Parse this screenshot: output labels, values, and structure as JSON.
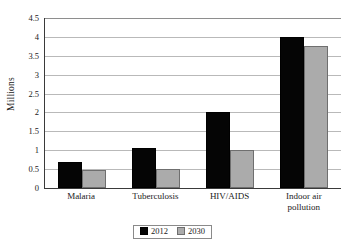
{
  "chart_data": {
    "type": "bar",
    "title": "",
    "subtitle": "",
    "xlabel": "",
    "ylabel": "Millions",
    "ylim": [
      0,
      4.5
    ],
    "ytick_labels": [
      "4.5",
      "4",
      "3.5",
      "3",
      "2.5",
      "2",
      "1.5",
      "1",
      "0.5",
      "0"
    ],
    "ytick_values": [
      4.5,
      4,
      3.5,
      3,
      2.5,
      2,
      1.5,
      1,
      0.5,
      0
    ],
    "grid": true,
    "legend_position": "bottom-center",
    "categories": [
      "Malaria",
      "Tuberculosis",
      "HIV/AIDS",
      "Indoor air pollution"
    ],
    "category_labels": [
      [
        "Malaria"
      ],
      [
        "Tuberculosis"
      ],
      [
        "HIV/AIDS"
      ],
      [
        "Indoor air",
        "pollution"
      ]
    ],
    "series": [
      {
        "name": "2012",
        "color": "#050505",
        "values": [
          0.68,
          1.05,
          2.0,
          4.0
        ]
      },
      {
        "name": "2030",
        "color": "#ababab",
        "values": [
          0.47,
          0.5,
          1.0,
          3.75
        ]
      }
    ]
  },
  "legend": {
    "items": [
      {
        "label": "2012",
        "swatch": "black-square-swatch"
      },
      {
        "label": "2030",
        "swatch": "gray-square-swatch"
      }
    ]
  }
}
